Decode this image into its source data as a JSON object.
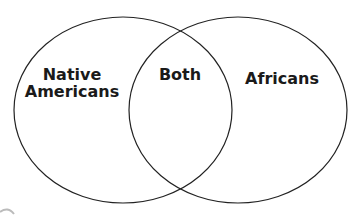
{
  "diagram": {
    "type": "venn",
    "sets": [
      {
        "id": "left",
        "label_lines": [
          "Native",
          "Americans"
        ]
      },
      {
        "id": "right",
        "label_lines": [
          "Africans"
        ]
      }
    ],
    "intersection": {
      "label": "Both"
    },
    "stroke_color": "#222222",
    "background": "#ffffff"
  }
}
